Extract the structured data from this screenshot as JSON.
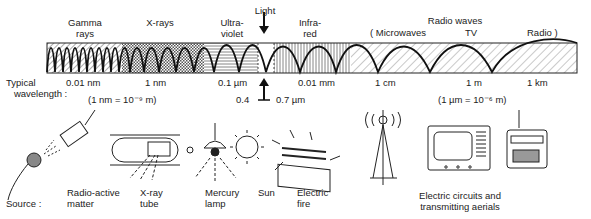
{
  "bands": [
    {
      "name": "gamma",
      "label_line1": "Gamma",
      "label_line2": "rays",
      "wavelength": "0.01 nm"
    },
    {
      "name": "x-rays",
      "label_line1": "X-rays",
      "label_line2": "",
      "wavelength": "1 nm"
    },
    {
      "name": "ultraviolet",
      "label_line1": "Ultra-",
      "label_line2": "violet",
      "wavelength": "0.1 µm"
    },
    {
      "name": "light",
      "label_line1": "Light",
      "label_line2": "",
      "wavelength": ""
    },
    {
      "name": "infrared",
      "label_line1": "Infra-",
      "label_line2": "red",
      "wavelength": "0.01 mm"
    },
    {
      "name": "radio",
      "label_line1": "Radio waves",
      "label_line2": "",
      "wavelength": ""
    }
  ],
  "radio_sub": {
    "microwaves": "( Microwaves",
    "tv": "TV",
    "radio": "Radio )"
  },
  "radio_wavelengths": {
    "microwaves": "1 cm",
    "tv": "1 m",
    "radio": "1 km"
  },
  "typical_label_line1": "Typical",
  "typical_label_line2": "wavelength :",
  "nm_note": "(1 nm = 10⁻⁹ m)",
  "um_note": "(1 µm = 10⁻⁶ m)",
  "light_range": {
    "low": "0.4",
    "high": "0.7 µm"
  },
  "source_label": "Source :",
  "sources": [
    {
      "name": "radioactive",
      "line1": "Radio-active",
      "line2": "matter",
      "icon": "radioactive-source-icon"
    },
    {
      "name": "xray-tube",
      "line1": "X-ray",
      "line2": "tube",
      "icon": "xray-tube-icon"
    },
    {
      "name": "mercury-lamp",
      "line1": "Mercury",
      "line2": "lamp",
      "icon": "mercury-lamp-icon"
    },
    {
      "name": "sun",
      "line1": "Sun",
      "line2": "",
      "icon": "sun-icon"
    },
    {
      "name": "electric-fire",
      "line1": "Electric",
      "line2": "fire",
      "icon": "electric-fire-icon"
    },
    {
      "name": "circuits",
      "line1": "Electric circuits and",
      "line2": "transmitting aerials",
      "icon": "transmitter-tv-radio-icons"
    }
  ]
}
